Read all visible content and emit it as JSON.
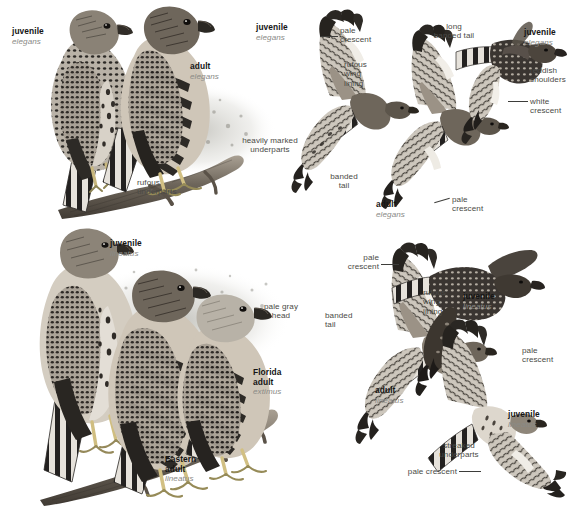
{
  "plate": {
    "title": "Red-shouldered Hawk plate",
    "background_color": "#ffffff",
    "ink_color": "#2b2b2b",
    "sci_color": "#8a8a86"
  },
  "panels": [
    {
      "id": "perched-elegans",
      "name": "perched-western-group",
      "labels": [
        {
          "id": "p1-juvenile",
          "name": "juvenile",
          "sci": "elegans",
          "kind": "taxon",
          "align": "left"
        },
        {
          "id": "p1-adult",
          "name": "adult",
          "sci": "elegans",
          "kind": "taxon",
          "align": "left"
        },
        {
          "id": "p1-rufous",
          "text": "rufous\nunderparts",
          "kind": "feature",
          "align": "left"
        }
      ]
    },
    {
      "id": "flight-elegans",
      "name": "flight-western-group",
      "labels": [
        {
          "id": "p2-juvenile",
          "name": "juvenile",
          "sci": "elegans",
          "kind": "taxon",
          "align": "left"
        },
        {
          "id": "p2-pale1",
          "text": "pale\ncrescent",
          "kind": "feature",
          "align": "left"
        },
        {
          "id": "p2-rufous",
          "text": "rufous\nwing\nlining",
          "kind": "feature",
          "align": "left"
        },
        {
          "id": "p2-heavy",
          "text": "heavily marked\nunderparts",
          "kind": "feature",
          "align": "center"
        },
        {
          "id": "p2-banded",
          "text": "banded\ntail",
          "kind": "feature",
          "align": "center"
        },
        {
          "id": "p2-adult",
          "name": "adult",
          "sci": "elegans",
          "kind": "taxon",
          "align": "left"
        },
        {
          "id": "p2-pale2",
          "text": "pale\ncrescent",
          "kind": "feature",
          "align": "left"
        }
      ]
    },
    {
      "id": "soaring-elegans",
      "name": "soaring-western-juvenile",
      "labels": [
        {
          "id": "p3-longtail",
          "text": "long\nbanded tail",
          "kind": "feature",
          "align": "center"
        },
        {
          "id": "p3-juvenile",
          "name": "juvenile",
          "sci": "elegans",
          "kind": "taxon",
          "align": "left"
        },
        {
          "id": "p3-reddish",
          "text": "reddish\nshoulders",
          "kind": "feature",
          "align": "left"
        },
        {
          "id": "p3-white",
          "text": "white\ncrescent",
          "kind": "feature",
          "align": "left"
        }
      ]
    },
    {
      "id": "perched-lineatus",
      "name": "perched-eastern-group",
      "labels": [
        {
          "id": "p4-juvenile",
          "name": "juvenile",
          "sci": "lineatus",
          "kind": "taxon",
          "align": "left"
        },
        {
          "id": "p4-palegray",
          "text": "pale gray\nhead",
          "kind": "feature",
          "align": "center"
        },
        {
          "id": "p4-florida",
          "name": "Florida\nadult",
          "sci": "extimus",
          "kind": "taxon",
          "align": "left"
        },
        {
          "id": "p4-eastern",
          "name": "Eastern\nadult",
          "sci": "lineatus",
          "kind": "taxon",
          "align": "left"
        }
      ]
    },
    {
      "id": "flight-lineatus",
      "name": "flight-eastern-group",
      "labels": [
        {
          "id": "p5-pale1",
          "text": "pale\ncrescent",
          "kind": "feature",
          "align": "right"
        },
        {
          "id": "p5-rufous",
          "text": "rufous\nwing\nlining",
          "kind": "feature",
          "align": "left"
        },
        {
          "id": "p5-banded",
          "text": "banded\ntail",
          "kind": "feature",
          "align": "left"
        },
        {
          "id": "p5-juv1",
          "name": "juvenile",
          "sci": "lineatus",
          "kind": "taxon",
          "align": "left"
        },
        {
          "id": "p5-pale2",
          "text": "pale\ncrescent",
          "kind": "feature",
          "align": "left"
        },
        {
          "id": "p5-adult",
          "name": "adult",
          "sci": "lineatus",
          "kind": "taxon",
          "align": "left"
        },
        {
          "id": "p5-juv2",
          "name": "juvenile",
          "sci": "lineatus",
          "kind": "taxon",
          "align": "left"
        },
        {
          "id": "p5-streaked",
          "text": "streaked\nunderparts",
          "kind": "feature",
          "align": "center"
        },
        {
          "id": "p5-pale3",
          "text": "pale crescent",
          "kind": "feature",
          "align": "right"
        }
      ]
    }
  ],
  "text": {
    "juvenile": "juvenile",
    "adult": "adult",
    "elegans": "elegans",
    "lineatus": "lineatus",
    "extimus": "extimus",
    "florida_adult": "Florida\nadult",
    "eastern_adult": "Eastern\nadult",
    "rufous_underparts": "rufous\nunderparts",
    "pale_crescent": "pale\ncrescent",
    "pale_crescent_inline": "pale crescent",
    "rufous_wing_lining": "rufous\nwing\nlining",
    "heavily_marked_underparts": "heavily marked\nunderparts",
    "banded_tail": "banded\ntail",
    "long_banded_tail": "long\nbanded tail",
    "reddish_shoulders": "reddish\nshoulders",
    "white_crescent": "white\ncrescent",
    "pale_gray_head": "pale gray\nhead",
    "streaked_underparts": "streaked\nunderparts"
  }
}
